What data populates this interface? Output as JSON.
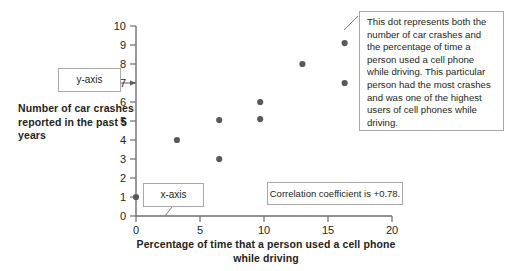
{
  "chart_data": {
    "type": "scatter",
    "title": "",
    "xlabel": "Percentage of time that a person used a cell phone while driving",
    "ylabel": "Number of car crashes reported in the past 5 years",
    "xlim": [
      0,
      20
    ],
    "ylim": [
      0,
      10
    ],
    "xticks": [
      0,
      5,
      10,
      15,
      20
    ],
    "yticks": [
      0,
      1,
      2,
      3,
      4,
      5,
      6,
      7,
      8,
      9,
      10
    ],
    "xtick_labels": [
      "0",
      "5",
      "10",
      "15",
      "20"
    ],
    "ytick_labels": [
      "0",
      "1",
      "2",
      "3",
      "4",
      "5",
      "6",
      "7",
      "8",
      "9",
      "10"
    ],
    "grid": false,
    "legend": false,
    "point_color": "#58595b",
    "points": [
      {
        "x": 0.0,
        "y": 1.0
      },
      {
        "x": 3.2,
        "y": 4.0
      },
      {
        "x": 6.5,
        "y": 3.0
      },
      {
        "x": 6.5,
        "y": 5.05
      },
      {
        "x": 9.7,
        "y": 5.1
      },
      {
        "x": 9.7,
        "y": 6.0
      },
      {
        "x": 13.0,
        "y": 8.0
      },
      {
        "x": 16.3,
        "y": 7.0
      },
      {
        "x": 16.3,
        "y": 9.1
      },
      {
        "x": 19.3,
        "y": 10.0
      }
    ],
    "annotations": [
      {
        "name": "y-axis-callout",
        "text": "y-axis",
        "points_to": {
          "x": 0,
          "y": 7
        }
      },
      {
        "name": "x-axis-callout",
        "text": "x-axis",
        "points_to": {
          "x": 2.1,
          "y": 0
        }
      },
      {
        "name": "correlation-callout",
        "text": "Correlation coefficient is +0.78."
      },
      {
        "name": "dot-callout",
        "text": "This dot represents both the number of car crashes and the percentage of time a person used a cell phone while driving. This particular person had the most crashes and was one of the highest users of cell phones while driving.",
        "points_to": {
          "x": 19.3,
          "y": 10
        }
      }
    ]
  },
  "axis_titles": {
    "y": "Number of car crashes reported in the past 5 years",
    "x": "Percentage of time that a person used a cell phone while driving"
  },
  "colors": {
    "point": "#58595b",
    "axis": "#6d6e71",
    "text": "#231f20",
    "callout_border": "#a7a9ac",
    "leader": "#808285"
  }
}
